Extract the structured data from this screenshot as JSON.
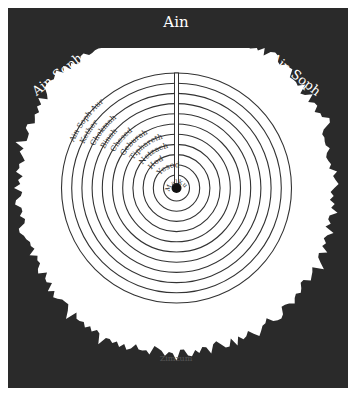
{
  "diagram": {
    "type": "concentric-circles",
    "background_color": "#2a2a2a",
    "light_color": "#ffffff",
    "line_color": "#333333",
    "outer_labels": {
      "top": "Ain",
      "left": "Ain Soph",
      "right": "Ain Soph",
      "bottom": "Zimzum"
    },
    "rings": [
      {
        "label": "Ain Soph Aur"
      },
      {
        "label": "Kether"
      },
      {
        "label": "Chokmah"
      },
      {
        "label": "Binah"
      },
      {
        "label": "Chesed"
      },
      {
        "label": "Geburah"
      },
      {
        "label": "Tiphareth"
      },
      {
        "label": "Netzach"
      },
      {
        "label": "Hod"
      },
      {
        "label": "Yesod"
      },
      {
        "label": "Malkuth"
      }
    ]
  }
}
